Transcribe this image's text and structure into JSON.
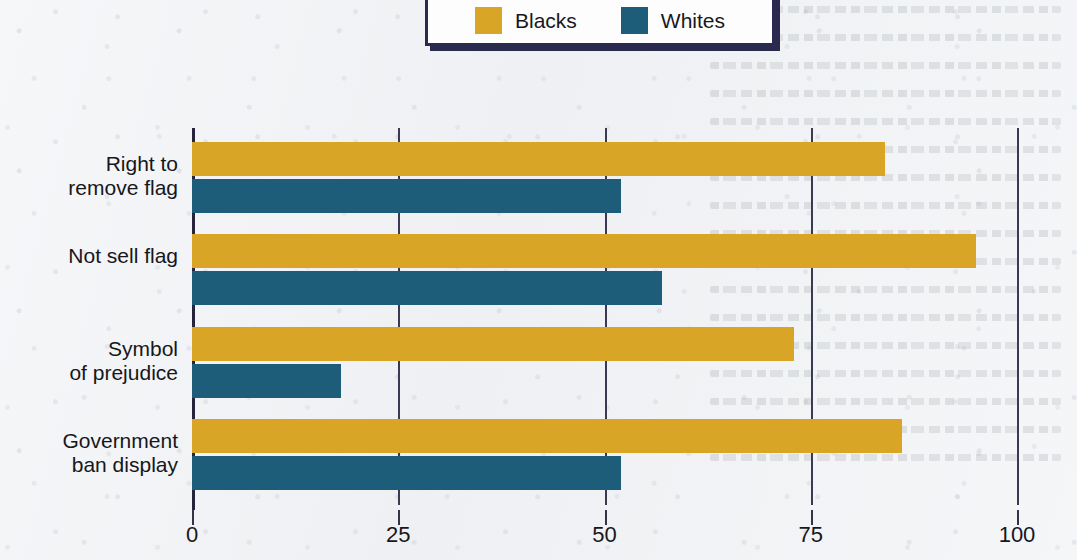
{
  "chart_data": {
    "type": "bar",
    "orientation": "horizontal",
    "title": "",
    "subtitle": "",
    "xlabel": "",
    "ylabel": "",
    "xlim": [
      0,
      100
    ],
    "xticks": [
      "0",
      "25",
      "50",
      "75",
      "100"
    ],
    "grid": true,
    "legend_position": "top-right",
    "categories": [
      "Right to\nremove flag",
      "Not sell flag",
      "Symbol\nof prejudice",
      "Government\nban display"
    ],
    "series": [
      {
        "name": "Blacks",
        "color": "#d9a526",
        "values": [
          84,
          95,
          73,
          86
        ]
      },
      {
        "name": "Whites",
        "color": "#1d5d79",
        "values": [
          52,
          57,
          18,
          52
        ]
      }
    ]
  },
  "legend": {
    "entries": [
      {
        "label": "Blacks",
        "color": "#d9a526"
      },
      {
        "label": "Whites",
        "color": "#1d5d79"
      }
    ]
  },
  "colors": {
    "blacks": "#d9a526",
    "whites": "#1d5d79",
    "axis": "#24243c",
    "legend_border": "#2a2a4e",
    "background": "#f3f4f6",
    "text": "#17171b"
  }
}
